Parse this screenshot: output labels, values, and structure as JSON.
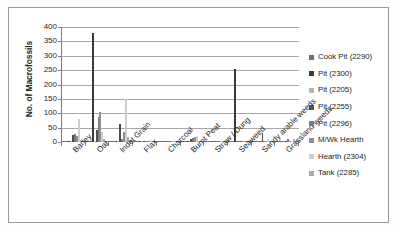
{
  "chart_data": {
    "type": "bar",
    "title": "",
    "xlabel": "",
    "ylabel": "No. of Macrofossils",
    "ylim": [
      0,
      400
    ],
    "ytick_values": [
      400,
      350,
      300,
      250,
      200,
      150,
      100,
      50,
      0
    ],
    "ytick_labels": [
      "400",
      "350",
      "300",
      "250",
      "200",
      "150",
      "100",
      "50",
      "0"
    ],
    "grid": true,
    "legend_position": "right",
    "categories": [
      "Barley",
      "Oat",
      "Indet Grain",
      "Flax",
      "Charcoal",
      "Burnt Peat",
      "Straw / Dung",
      "Seaweed",
      "Sandy arable weeds",
      "Grassland weeds"
    ],
    "series": [
      {
        "name": "Cook Pit (2290)",
        "color": "#6e6e6e",
        "values": [
          4,
          3,
          2,
          0,
          0,
          2,
          0,
          0,
          0,
          0
        ]
      },
      {
        "name": "Pit (2300)",
        "color": "#3a3a3a",
        "values": [
          2,
          378,
          1,
          1,
          0,
          2,
          0,
          255,
          0,
          0
        ]
      },
      {
        "name": "Pit (2205)",
        "color": "#b4b4b4",
        "values": [
          1,
          5,
          3,
          1,
          0,
          3,
          0,
          0,
          0,
          0
        ]
      },
      {
        "name": "Pit (2255)",
        "color": "#4f4f4f",
        "values": [
          24,
          42,
          64,
          1,
          0,
          12,
          0,
          0,
          30,
          2
        ]
      },
      {
        "name": "Pit (2296)",
        "color": "#7a7a7a",
        "values": [
          28,
          88,
          12,
          1,
          2,
          14,
          1,
          0,
          3,
          9
        ]
      },
      {
        "name": "M/Wk Hearth",
        "color": "#8e8e8e",
        "values": [
          20,
          103,
          36,
          2,
          3,
          18,
          0,
          2,
          2,
          3
        ]
      },
      {
        "name": "Hearth (2304)",
        "color": "#cfcfcf",
        "values": [
          81,
          36,
          150,
          8,
          2,
          20,
          2,
          1,
          11,
          3
        ]
      },
      {
        "name": "Tank (2285)",
        "color": "#a9a9a9",
        "values": [
          6,
          12,
          16,
          2,
          1,
          4,
          1,
          0,
          2,
          12
        ]
      }
    ]
  }
}
